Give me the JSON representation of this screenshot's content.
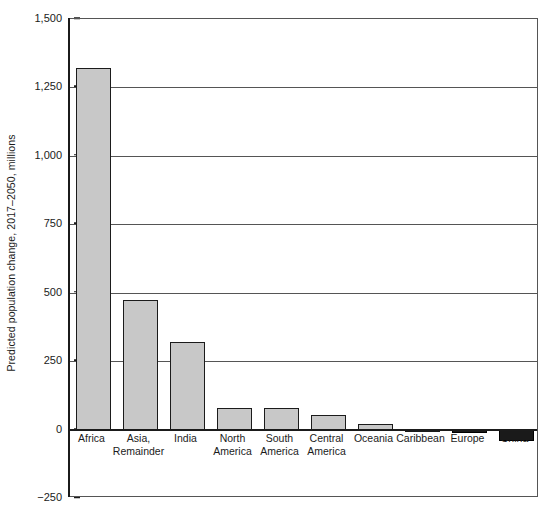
{
  "chart_data": {
    "type": "bar",
    "title": "",
    "subtitle": "",
    "xlabel": "",
    "ylabel": "Predicted population change, 2017–2050, millions",
    "ylim": [
      -250,
      1500
    ],
    "yticks": [
      1500,
      1250,
      1000,
      750,
      500,
      250,
      0,
      -250
    ],
    "ytick_labels": [
      "1,500",
      "1,250",
      "1,000",
      "750",
      "500",
      "250",
      "0",
      "−250"
    ],
    "grid": true,
    "grid_axis": "y",
    "legend": false,
    "legend_position": "none",
    "bar_color_positive": "#c8c8c8",
    "bar_color_negative": "#1a1a1a",
    "bar_edge_color": "#1b1b1b",
    "categories": [
      "Africa",
      "Asia,\nRemainder",
      "India",
      "North\nAmerica",
      "South\nAmerica",
      "Central\nAmerica",
      "Oceania",
      "Caribbean",
      "Europe",
      "China"
    ],
    "values": [
      1320,
      475,
      320,
      80,
      80,
      55,
      20,
      2,
      -12,
      -40
    ],
    "series": [
      {
        "name": "Predicted population change 2017–2050",
        "values": [
          1320,
          475,
          320,
          80,
          80,
          55,
          20,
          2,
          -12,
          -40
        ]
      }
    ]
  }
}
